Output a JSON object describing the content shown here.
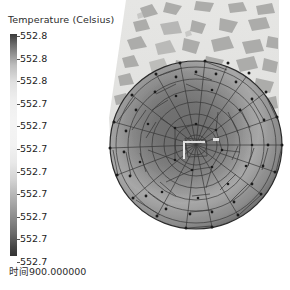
{
  "window": {
    "title": "Temperature (Celsius)",
    "background_color": "#ffffff"
  },
  "legend": {
    "title": "Temperature (Celsius)",
    "orientation": "vertical",
    "colormap": "grayscale",
    "colorbar_top_color": "#3a3a3a",
    "colorbar_mid_color": "#f4f4f4",
    "colorbar_bottom_color": "#333333",
    "ticks": [
      {
        "label": "552.8"
      },
      {
        "label": "552.8"
      },
      {
        "label": "552.8"
      },
      {
        "label": "552.7"
      },
      {
        "label": "552.7"
      },
      {
        "label": "552.7"
      },
      {
        "label": "552.7"
      },
      {
        "label": "552.7"
      },
      {
        "label": "552.7"
      },
      {
        "label": "552.7"
      },
      {
        "label": "552.7"
      }
    ]
  },
  "status": {
    "time_label": "时间900.000000"
  },
  "scene": {
    "panel_color": "#e3e3e1",
    "fragment_color": "#a8a8a6",
    "mesh_edge_color": "#3c3c3c",
    "mesh_node_color": "#1e1e1e",
    "object_name": "circular-triangulated-mesh",
    "marker_name": "center-probe-marker"
  },
  "chart_data": {
    "type": "heatmap",
    "title": "Temperature (Celsius)",
    "colorbar_label": "Temperature (Celsius)",
    "colormap": "grayscale",
    "tick_labels": [
      "552.8",
      "552.8",
      "552.8",
      "552.7",
      "552.7",
      "552.7",
      "552.7",
      "552.7",
      "552.7",
      "552.7",
      "552.7"
    ],
    "value_range": [
      552.7,
      552.8
    ],
    "annotation": "时间900.000000",
    "geometry": "circular triangulated finite-element mesh",
    "legend_position": "left"
  }
}
